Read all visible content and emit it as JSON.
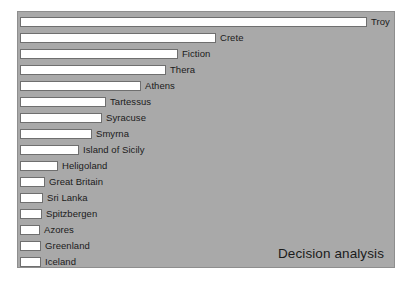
{
  "figure": {
    "watermark": "Decision analysis",
    "background_color": "#a9a9a9",
    "border_color": "#8e8e8e",
    "bar_fill_color": "#ffffff",
    "bar_border_color": "#6f6f6f",
    "label_color": "#1b1b1b"
  },
  "chart_data": {
    "type": "bar",
    "orientation": "horizontal",
    "title": "",
    "subtitle": "",
    "xlabel": "",
    "ylabel": "",
    "grid": false,
    "legend": false,
    "annotations": [
      "Decision analysis"
    ],
    "axis_visible": false,
    "tick_labels": [],
    "xlim": [
      0,
      347
    ],
    "categories": [
      "Troy",
      "Crete",
      "Fiction",
      "Thera",
      "Athens",
      "Tartessus",
      "Syracuse",
      "Smyrna",
      "Island of Sicily",
      "Heligoland",
      "Great Britain",
      "Sri Lanka",
      "Spitzbergen",
      "Azores",
      "Greenland",
      "Iceland"
    ],
    "values": [
      347,
      196,
      158,
      146,
      121,
      86,
      82,
      72,
      59,
      38,
      25,
      23,
      22,
      20,
      21,
      21
    ],
    "bars": [
      {
        "label": "Troy",
        "value": 347
      },
      {
        "label": "Crete",
        "value": 196
      },
      {
        "label": "Fiction",
        "value": 158
      },
      {
        "label": "Thera",
        "value": 146
      },
      {
        "label": "Athens",
        "value": 121
      },
      {
        "label": "Tartessus",
        "value": 86
      },
      {
        "label": "Syracuse",
        "value": 82
      },
      {
        "label": "Smyrna",
        "value": 72
      },
      {
        "label": "Island of Sicily",
        "value": 59
      },
      {
        "label": "Heligoland",
        "value": 38
      },
      {
        "label": "Great Britain",
        "value": 25
      },
      {
        "label": "Sri Lanka",
        "value": 23
      },
      {
        "label": "Spitzbergen",
        "value": 22
      },
      {
        "label": "Azores",
        "value": 20
      },
      {
        "label": "Greenland",
        "value": 21
      },
      {
        "label": "Iceland",
        "value": 21
      }
    ]
  }
}
